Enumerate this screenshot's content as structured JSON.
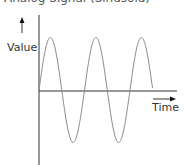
{
  "title": "Analog Signal (Sinusoid)",
  "axes": {
    "y_label": "Value",
    "x_label": "Time"
  },
  "colors": {
    "axis": "#333333",
    "wave": "#8a8a8a"
  },
  "chart_data": {
    "type": "line",
    "title": "Analog Signal (Sinusoid)",
    "xlabel": "Time",
    "ylabel": "Value",
    "series": [
      {
        "name": "sine wave",
        "shape": "sine",
        "cycles": 2.5,
        "start_phase": 0
      }
    ],
    "grid": false,
    "legend": false
  }
}
